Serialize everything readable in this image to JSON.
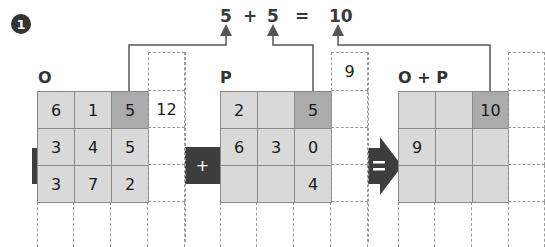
{
  "step_badge": "1",
  "equation": {
    "left": "5",
    "plus": "+",
    "right": "5",
    "equals": "=",
    "result": "10"
  },
  "grids": {
    "o": {
      "label": "O",
      "rows": [
        [
          "6",
          "1",
          "5"
        ],
        [
          "3",
          "4",
          "5"
        ],
        [
          "3",
          "7",
          "2"
        ]
      ],
      "highlight": [
        0,
        2
      ],
      "carry_cells": [
        "",
        "12",
        "",
        "",
        ""
      ]
    },
    "p": {
      "label": "P",
      "rows": [
        [
          "2",
          "",
          "5"
        ],
        [
          "6",
          "3",
          "0"
        ],
        [
          "",
          "",
          "4"
        ]
      ],
      "highlight": [
        0,
        2
      ],
      "carry_top": "9"
    },
    "sum": {
      "label": "O + P",
      "rows": [
        [
          "",
          "",
          "10"
        ],
        [
          "9",
          "",
          ""
        ],
        [
          "",
          "",
          ""
        ]
      ],
      "highlight": [
        0,
        2
      ]
    }
  },
  "operators": {
    "plus": "+",
    "equals": "="
  },
  "colors": {
    "cell": "#d9d9d9",
    "highlight": "#ababab",
    "operator": "#3d3d3d",
    "line": "#555555",
    "dash": "#9a9a9a"
  }
}
